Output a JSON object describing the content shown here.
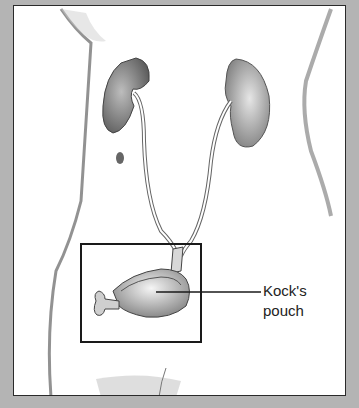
{
  "figure": {
    "labels": [
      {
        "line1": "Kock's",
        "line2": "pouch"
      }
    ],
    "highlight_box": {
      "x": 80,
      "y": 243,
      "width": 120,
      "height": 98
    },
    "colors": {
      "border_bg": "#b4b4b4",
      "panel": "#ffffff",
      "ink": "#2a2a2a",
      "shade": "#8a8a8a"
    }
  }
}
